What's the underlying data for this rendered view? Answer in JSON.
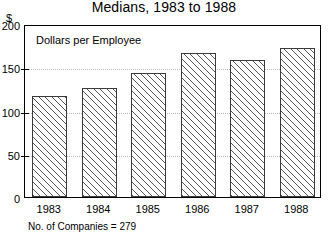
{
  "chart_data": {
    "type": "bar",
    "title": "Medians, 1983 to 1988",
    "xlabel": "",
    "ylabel": "$",
    "annotation": "Dollars per Employee",
    "footnote": "No. of Companies = 279",
    "categories": [
      "1983",
      "1984",
      "1985",
      "1986",
      "1987",
      "1988"
    ],
    "values": [
      117,
      126,
      143,
      166,
      158,
      172
    ],
    "series": [
      {
        "name": "Dollars per Employee",
        "values": [
          117,
          126,
          143,
          166,
          158,
          172
        ]
      }
    ],
    "ylim": [
      0,
      200
    ],
    "yticks": [
      0,
      50,
      100,
      150,
      200
    ],
    "ytick_labels": [
      "0",
      "50",
      "100",
      "150",
      "200"
    ],
    "grid": true,
    "grid_axis": "y",
    "legend": false,
    "legend_position": "none",
    "bar_fill": "diagonal-hatch",
    "bar_edge_color": "#3a3a3a",
    "grid_color": "#b8b8b8",
    "axis_color": "#000000"
  }
}
